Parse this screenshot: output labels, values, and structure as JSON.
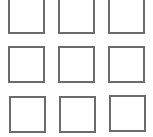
{
  "grid": {
    "rows": 3,
    "cols": 3,
    "border_color": "#6b6b6b",
    "cells": [
      {
        "row": 0,
        "col": 0,
        "x": 8,
        "y": -3
      },
      {
        "row": 0,
        "col": 1,
        "x": 58,
        "y": -3
      },
      {
        "row": 0,
        "col": 2,
        "x": 108,
        "y": -3
      },
      {
        "row": 1,
        "col": 0,
        "x": 8,
        "y": 46
      },
      {
        "row": 1,
        "col": 1,
        "x": 58,
        "y": 46
      },
      {
        "row": 1,
        "col": 2,
        "x": 108,
        "y": 46
      },
      {
        "row": 2,
        "col": 0,
        "x": 9,
        "y": 96
      },
      {
        "row": 2,
        "col": 1,
        "x": 59,
        "y": 96
      },
      {
        "row": 2,
        "col": 2,
        "x": 109,
        "y": 95
      }
    ]
  }
}
